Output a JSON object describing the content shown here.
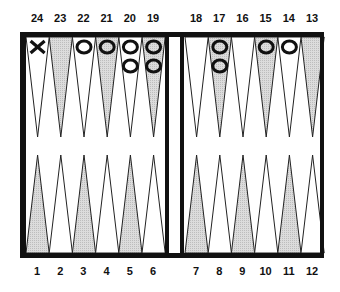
{
  "board": {
    "title": "Backgammon board diagram",
    "colors": {
      "frame": "#111111",
      "shaded_point": "#d4d4d4",
      "light_point": "#ffffff",
      "line": "#222222"
    },
    "top_numbers": [
      "24",
      "23",
      "22",
      "21",
      "20",
      "19",
      "18",
      "17",
      "16",
      "15",
      "14",
      "13"
    ],
    "bottom_numbers": [
      "1",
      "2",
      "3",
      "4",
      "5",
      "6",
      "7",
      "8",
      "9",
      "10",
      "11",
      "12"
    ],
    "shaded_top": [
      23,
      21,
      19,
      17,
      15,
      13
    ],
    "shaded_bottom": [
      1,
      3,
      5,
      7,
      9,
      11
    ],
    "checkers": [
      {
        "point": 24,
        "player": "X",
        "count": 1
      },
      {
        "point": 22,
        "player": "O",
        "count": 1
      },
      {
        "point": 21,
        "player": "O",
        "count": 1
      },
      {
        "point": 20,
        "player": "O",
        "count": 2
      },
      {
        "point": 19,
        "player": "O",
        "count": 2
      },
      {
        "point": 17,
        "player": "O",
        "count": 2
      },
      {
        "point": 15,
        "player": "O",
        "count": 1
      },
      {
        "point": 14,
        "player": "O",
        "count": 1
      }
    ]
  }
}
